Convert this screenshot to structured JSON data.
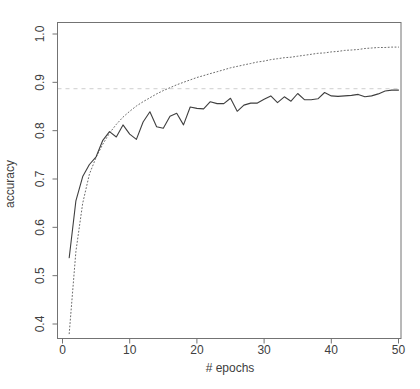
{
  "chart_data": {
    "type": "line",
    "title": "",
    "xlabel": "# epochs",
    "ylabel": "accuracy",
    "grid": false,
    "legend": false,
    "background": "#ffffff",
    "axis_color": "#737373",
    "text_color": "#404040",
    "xlim": [
      -1,
      52
    ],
    "ylim": [
      0.37,
      1.02
    ],
    "x_ticks": [
      0,
      10,
      20,
      30,
      40,
      50
    ],
    "y_ticks": [
      0.4,
      0.5,
      0.6,
      0.7,
      0.8,
      0.9,
      1.0
    ],
    "x": [
      1,
      2,
      3,
      4,
      5,
      6,
      7,
      8,
      9,
      10,
      11,
      12,
      13,
      14,
      15,
      16,
      17,
      18,
      19,
      20,
      21,
      22,
      23,
      24,
      25,
      26,
      27,
      28,
      29,
      30,
      31,
      32,
      33,
      34,
      35,
      36,
      37,
      38,
      39,
      40,
      41,
      42,
      43,
      44,
      45,
      46,
      47,
      48,
      49,
      50
    ],
    "series": [
      {
        "name": "dotted-curve",
        "style": "dotted",
        "color": "#5a5a5a",
        "values": [
          0.38,
          0.55,
          0.65,
          0.71,
          0.745,
          0.772,
          0.795,
          0.813,
          0.828,
          0.84,
          0.851,
          0.86,
          0.868,
          0.876,
          0.883,
          0.889,
          0.895,
          0.9,
          0.905,
          0.91,
          0.914,
          0.918,
          0.922,
          0.926,
          0.93,
          0.933,
          0.936,
          0.939,
          0.942,
          0.944,
          0.947,
          0.949,
          0.951,
          0.952,
          0.954,
          0.956,
          0.958,
          0.96,
          0.961,
          0.963,
          0.964,
          0.966,
          0.967,
          0.968,
          0.97,
          0.971,
          0.972,
          0.972,
          0.973,
          0.973
        ]
      },
      {
        "name": "solid-curve",
        "style": "solid",
        "color": "#3f3f3f",
        "values": [
          0.537,
          0.655,
          0.705,
          0.73,
          0.746,
          0.78,
          0.798,
          0.787,
          0.812,
          0.793,
          0.782,
          0.818,
          0.839,
          0.808,
          0.805,
          0.83,
          0.836,
          0.812,
          0.849,
          0.846,
          0.845,
          0.86,
          0.856,
          0.856,
          0.867,
          0.84,
          0.853,
          0.857,
          0.857,
          0.865,
          0.872,
          0.858,
          0.87,
          0.861,
          0.877,
          0.864,
          0.864,
          0.866,
          0.879,
          0.872,
          0.871,
          0.872,
          0.873,
          0.875,
          0.87,
          0.872,
          0.876,
          0.882,
          0.884,
          0.884
        ]
      }
    ],
    "reference_line": {
      "orientation": "horizontal",
      "value": 0.887,
      "style": "dashed",
      "color": "#d8d8d8"
    }
  }
}
